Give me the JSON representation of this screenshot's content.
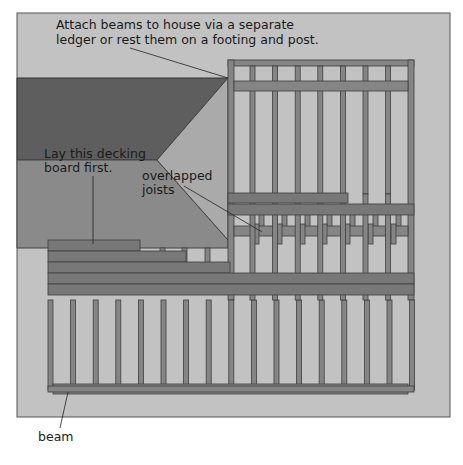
{
  "diagram": {
    "colors": {
      "panel_bg": "#c2c2c2",
      "panel_border": "#555555",
      "roof_dark": "#5e5e5e",
      "roof_mid": "#8a8a8a",
      "roof_light": "#aaaaaa",
      "lumber": "#858585",
      "lumber_edge": "#3e3e3e",
      "decking": "#787878",
      "leader": "#222222"
    },
    "labels": {
      "attach_line1": "Attach beams to house via a separate",
      "attach_line2": "ledger or rest them on a footing and post.",
      "lay_line1": "Lay this decking",
      "lay_line2": "board first.",
      "overlap_line1": "overlapped",
      "overlap_line2": "joists",
      "beam": "beam"
    },
    "upper_section": {
      "joist_count": 9,
      "beam_count": 1
    },
    "lower_section": {
      "joist_count": 17,
      "beam_count": 1
    },
    "decking_boards_shown": 5
  }
}
